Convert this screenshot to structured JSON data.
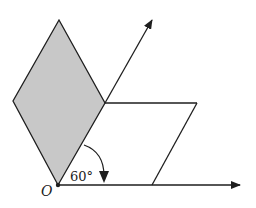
{
  "diagram": {
    "colors": {
      "stroke": "#1e1e1e",
      "shade": "#c8c8c8",
      "background": "#ffffff"
    },
    "labels": {
      "origin": "O",
      "angle": "60°"
    },
    "points": {
      "O": [
        58,
        185
      ],
      "rhombus_top": [
        59,
        20
      ],
      "rhombus_left": [
        13,
        101
      ],
      "rhombus_right": [
        105,
        103
      ],
      "upper_arrow_tip": [
        152,
        18
      ],
      "para_top_right": [
        197,
        103
      ],
      "para_bottom_right": [
        152,
        185
      ],
      "horizontal_arrow_tip": [
        241,
        186
      ]
    }
  }
}
